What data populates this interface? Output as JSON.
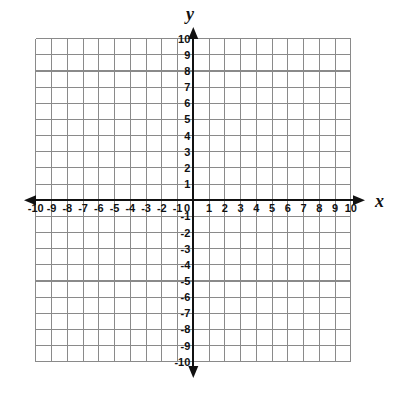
{
  "chart_data": {
    "type": "scatter",
    "title": "",
    "subtitle": "",
    "xlabel": "x",
    "ylabel": "y",
    "xlim": [
      -10,
      10
    ],
    "ylim": [
      -10,
      10
    ],
    "grid": true,
    "grid_step": 1,
    "legend": "none",
    "series": [],
    "x": [],
    "y": [],
    "annotations": [],
    "x_ticks": [
      -10,
      -9,
      -8,
      -7,
      -6,
      -5,
      -4,
      -3,
      -2,
      -1,
      1,
      2,
      3,
      4,
      5,
      6,
      7,
      8,
      9,
      10
    ],
    "y_ticks": [
      10,
      9,
      8,
      7,
      6,
      5,
      4,
      3,
      2,
      1,
      -1,
      -2,
      -3,
      -4,
      -5,
      -6,
      -7,
      -8,
      -9,
      -10
    ],
    "x_tick_labels": [
      "-10",
      "-9",
      "-8",
      "-7",
      "-6",
      "-5",
      "-4",
      "-3",
      "-2",
      "-1",
      "1",
      "2",
      "3",
      "4",
      "5",
      "6",
      "7",
      "8",
      "9",
      "10"
    ],
    "y_tick_labels": [
      "10",
      "9",
      "8",
      "7",
      "6",
      "5",
      "4",
      "3",
      "2",
      "1",
      "-1",
      "-2",
      "-3",
      "-4",
      "-5",
      "-6",
      "-7",
      "-8",
      "-9",
      "-10"
    ],
    "origin_label": "0",
    "axis_arrows": [
      "left",
      "right",
      "up",
      "down"
    ]
  },
  "axes": {
    "x_axis_name": "x",
    "y_axis_name": "y"
  },
  "colors": {
    "grid": "#8a8a8a",
    "axis": "#111111",
    "background": "#ffffff",
    "label": "#111111"
  }
}
